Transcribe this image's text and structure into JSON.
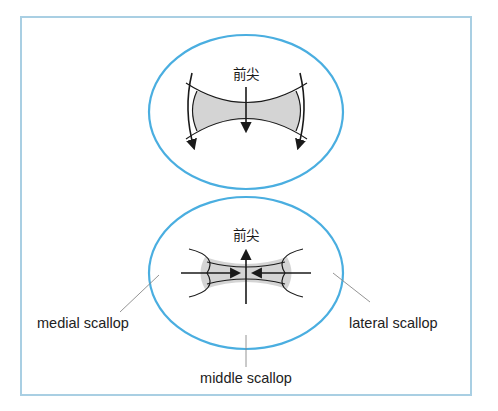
{
  "diagram": {
    "border_color": "#a9cfe3",
    "ellipse_color": "#4aaee0",
    "fill_color": "#d4d4d4",
    "stroke_color": "#1a1a1a",
    "leader_color": "#888888",
    "top_panel": {
      "label": "前尖",
      "description": "Arrows pointing downward (away from anterior) with concave-sided shaded region"
    },
    "bottom_panel": {
      "label": "前尖",
      "description": "Upward arrow with horizontal arrows pointing inward toward shaded concave region",
      "callouts": {
        "medial": "medial scallop",
        "lateral": "lateral scallop",
        "middle": "middle scallop"
      }
    }
  }
}
